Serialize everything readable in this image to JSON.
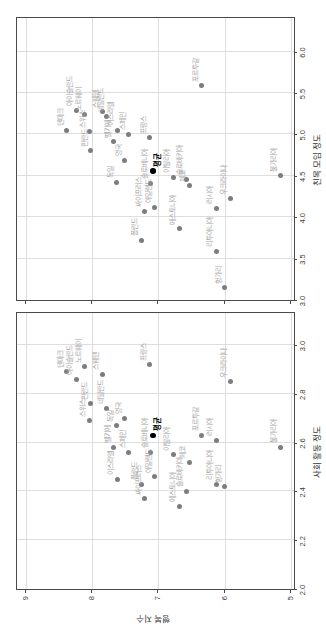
{
  "figure": {
    "colors": {
      "dot": "#7d7d7d",
      "dot_label": "#a6a6a6",
      "mean": "#000000",
      "grid": "#dedede",
      "spine": "#4a4a4a",
      "tick_text": "#3c3c3c",
      "background": "#ffffff"
    }
  },
  "chart_data": [
    {
      "type": "scatter",
      "title": "",
      "xlabel": "사회 활동 정도",
      "ylabel": "행복 지수",
      "xlim": [
        2.0,
        3.131
      ],
      "ylim": [
        4.96,
        9.13
      ],
      "xticks": [
        2.0,
        2.2,
        2.4,
        2.6,
        2.8,
        3.0
      ],
      "xtick_labels": [
        "2.0",
        "2.2",
        "2.4",
        "2.6",
        "2.8",
        "3.0"
      ],
      "yticks": [
        5,
        6,
        7,
        8,
        9
      ],
      "ytick_labels": [
        "5",
        "6",
        "7",
        "8",
        "9"
      ],
      "show_ytick_labels": true,
      "grid": true,
      "legend": "none",
      "series": [
        {
          "name": "countries",
          "points": [
            {
              "label": "덴마크",
              "x": 2.89,
              "y": 8.38
            },
            {
              "label": "아이슬란드",
              "x": 2.86,
              "y": 8.24
            },
            {
              "label": "노르웨이",
              "x": 2.91,
              "y": 8.11
            },
            {
              "label": "스위스",
              "x": 2.69,
              "y": 8.04
            },
            {
              "label": "핀란드",
              "x": 2.76,
              "y": 8.02
            },
            {
              "label": "스웨덴",
              "x": 2.88,
              "y": 7.85
            },
            {
              "label": "네덜란드",
              "x": 2.74,
              "y": 7.78
            },
            {
              "label": "벨기에",
              "x": 2.58,
              "y": 7.67
            },
            {
              "label": "독일",
              "x": 2.67,
              "y": 7.63
            },
            {
              "label": "이스라엘",
              "x": 2.45,
              "y": 7.62
            },
            {
              "label": "영국",
              "x": 2.7,
              "y": 7.51
            },
            {
              "label": "스페인",
              "x": 2.56,
              "y": 7.45
            },
            {
              "label": "폴란드",
              "x": 2.43,
              "y": 7.26
            },
            {
              "label": "싸이프러스",
              "x": 2.37,
              "y": 7.21
            },
            {
              "label": "프랑스",
              "x": 2.92,
              "y": 7.13
            },
            {
              "label": "슬로베니아",
              "x": 2.56,
              "y": 7.12
            },
            {
              "label": "아일랜드",
              "x": 2.46,
              "y": 7.06
            },
            {
              "label": "이탈리아",
              "x": 2.55,
              "y": 6.78
            },
            {
              "label": "에스토니아",
              "x": 2.34,
              "y": 6.69
            },
            {
              "label": "슬로바키아",
              "x": 2.4,
              "y": 6.58
            },
            {
              "label": "체코",
              "x": 2.52,
              "y": 6.54
            },
            {
              "label": "포르투갈",
              "x": 2.63,
              "y": 6.35
            },
            {
              "label": "러시아",
              "x": 2.61,
              "y": 6.13
            },
            {
              "label": "리투아니아",
              "x": 2.43,
              "y": 6.13
            },
            {
              "label": "헝가리",
              "x": 2.42,
              "y": 6.0
            },
            {
              "label": "우크라이나",
              "x": 2.85,
              "y": 5.92
            },
            {
              "label": "불가리아",
              "x": 2.58,
              "y": 5.17
            }
          ]
        },
        {
          "name": "average",
          "emphasis": true,
          "points": [
            {
              "label": "평균",
              "x": 2.63,
              "y": 7.08
            }
          ]
        }
      ]
    },
    {
      "type": "scatter",
      "title": "",
      "xlabel": "친목 모임 정도",
      "ylabel": "",
      "xlim": [
        3.0,
        6.405
      ],
      "ylim": [
        4.96,
        9.13
      ],
      "xticks": [
        3.0,
        3.5,
        4.0,
        4.5,
        5.0,
        5.5,
        6.0
      ],
      "xtick_labels": [
        "3.0",
        "3.5",
        "4.0",
        "4.5",
        "5.0",
        "5.5",
        "6.0"
      ],
      "yticks": [
        5,
        6,
        7,
        8,
        9
      ],
      "ytick_labels": [
        "5",
        "6",
        "7",
        "8",
        "9"
      ],
      "show_ytick_labels": false,
      "grid": true,
      "legend": "none",
      "series": [
        {
          "name": "countries",
          "points": [
            {
              "label": "덴마크",
              "x": 5.05,
              "y": 8.38
            },
            {
              "label": "아이슬란드",
              "x": 5.29,
              "y": 8.24
            },
            {
              "label": "노르웨이",
              "x": 5.24,
              "y": 8.11
            },
            {
              "label": "스위스",
              "x": 5.03,
              "y": 8.04
            },
            {
              "label": "핀란드",
              "x": 4.8,
              "y": 8.02
            },
            {
              "label": "스웨덴",
              "x": 5.27,
              "y": 7.85
            },
            {
              "label": "네덜란드",
              "x": 5.22,
              "y": 7.78
            },
            {
              "label": "벨기에",
              "x": 4.91,
              "y": 7.67
            },
            {
              "label": "독일",
              "x": 4.42,
              "y": 7.63
            },
            {
              "label": "이스라엘",
              "x": 5.05,
              "y": 7.62
            },
            {
              "label": "영국",
              "x": 4.69,
              "y": 7.51
            },
            {
              "label": "스페인",
              "x": 5.0,
              "y": 7.45
            },
            {
              "label": "폴란드",
              "x": 3.72,
              "y": 7.26
            },
            {
              "label": "싸이프러스",
              "x": 4.07,
              "y": 7.21
            },
            {
              "label": "프랑스",
              "x": 4.96,
              "y": 7.13
            },
            {
              "label": "슬로베니아",
              "x": 4.41,
              "y": 7.12
            },
            {
              "label": "아일랜드",
              "x": 4.12,
              "y": 7.06
            },
            {
              "label": "이탈리아",
              "x": 4.48,
              "y": 6.78
            },
            {
              "label": "에스토니아",
              "x": 3.86,
              "y": 6.69
            },
            {
              "label": "슬로바키아",
              "x": 4.46,
              "y": 6.58
            },
            {
              "label": "체코",
              "x": 4.38,
              "y": 6.54
            },
            {
              "label": "포르투갈",
              "x": 5.59,
              "y": 6.35
            },
            {
              "label": "러시아",
              "x": 4.11,
              "y": 6.13
            },
            {
              "label": "리투아니아",
              "x": 3.59,
              "y": 6.13
            },
            {
              "label": "헝가리",
              "x": 3.15,
              "y": 6.0
            },
            {
              "label": "우크라이나",
              "x": 4.22,
              "y": 5.92
            },
            {
              "label": "불가리아",
              "x": 4.5,
              "y": 5.17
            }
          ]
        },
        {
          "name": "average",
          "emphasis": true,
          "points": [
            {
              "label": "평균",
              "x": 4.56,
              "y": 7.08
            }
          ]
        }
      ]
    }
  ]
}
